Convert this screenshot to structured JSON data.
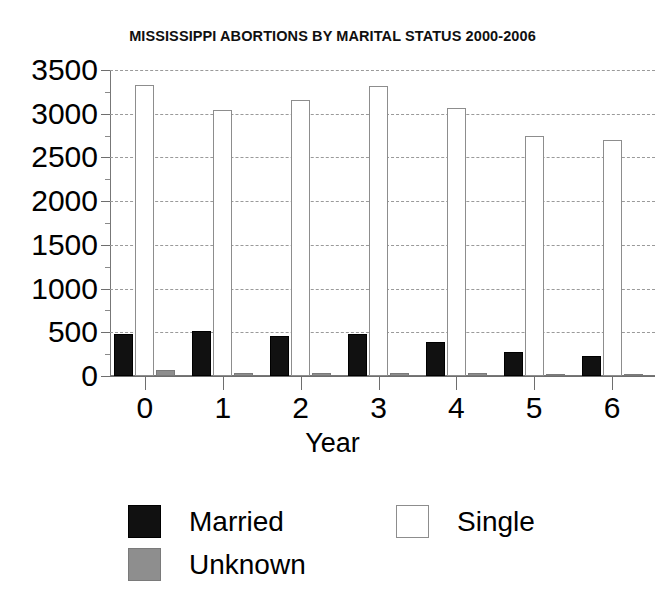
{
  "chart_data": {
    "type": "bar",
    "title": "MISSISSIPPI ABORTIONS BY MARITAL STATUS 2000-2006",
    "xlabel": "Year",
    "ylabel": "",
    "categories": [
      "0",
      "1",
      "2",
      "3",
      "4",
      "5",
      "6"
    ],
    "series": [
      {
        "name": "Married",
        "color": "#111111",
        "values": [
          480,
          515,
          455,
          480,
          385,
          275,
          225
        ]
      },
      {
        "name": "Single",
        "color": "#ffffff",
        "values": [
          3330,
          3040,
          3160,
          3320,
          3065,
          2745,
          2700
        ]
      },
      {
        "name": "Unknown",
        "color": "#8e8e8e",
        "values": [
          70,
          10,
          15,
          40,
          5,
          0,
          0
        ]
      }
    ],
    "ylim": [
      0,
      3500
    ],
    "ytick_values": [
      0,
      500,
      1000,
      1500,
      2000,
      2500,
      3000,
      3500
    ],
    "ytick_labels": [
      "0",
      "500",
      "1000",
      "1500",
      "2000",
      "2500",
      "3000",
      "3500"
    ],
    "yminor_step": 250,
    "xtick_labels": [
      "0",
      "1",
      "2",
      "3",
      "4",
      "5",
      "6"
    ],
    "grid": true,
    "grid_style": "dotted-horizontal",
    "legend_position": "bottom",
    "legend_entries": [
      "Married",
      "Single",
      "Unknown"
    ]
  },
  "legend": {
    "married_label": "Married",
    "single_label": "Single",
    "unknown_label": "Unknown"
  },
  "axis": {
    "x_title": "Year"
  }
}
